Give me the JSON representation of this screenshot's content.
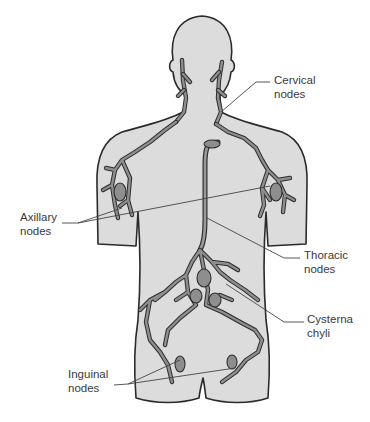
{
  "figure": {
    "colors": {
      "background": "#ffffff",
      "body_fill": "#dcdcdc",
      "outline": "#2a2a2a",
      "lymph_vessel": "#8e8e8e",
      "label_text": "#3a3a3a"
    }
  },
  "labels": {
    "cervical": {
      "line1": "Cervical",
      "line2": "nodes"
    },
    "axillary": {
      "line1": "Axillary",
      "line2": "nodes"
    },
    "thoracic": {
      "line1": "Thoracic",
      "line2": "nodes"
    },
    "cysterna": {
      "line1": "Cysterna",
      "line2": "chyli"
    },
    "inguinal": {
      "line1": "Inguinal",
      "line2": "nodes"
    }
  }
}
